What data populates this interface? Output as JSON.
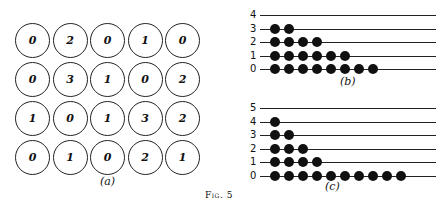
{
  "figure_label": "Fig. 5",
  "panel_a": {
    "caption": "(a)",
    "grid": [
      [
        0,
        2,
        0,
        1,
        0
      ],
      [
        0,
        3,
        1,
        0,
        2
      ],
      [
        1,
        0,
        1,
        3,
        2
      ],
      [
        0,
        1,
        0,
        2,
        1
      ]
    ]
  },
  "chart_data": [
    {
      "type": "scatter",
      "title": "(b)",
      "categories": [
        "4",
        "3",
        "2",
        "1",
        "0"
      ],
      "values": [
        0,
        2,
        4,
        6,
        8
      ],
      "xlabel": "",
      "ylabel": "",
      "grid": false
    },
    {
      "type": "scatter",
      "title": "(c)",
      "categories": [
        "5",
        "4",
        "3",
        "2",
        "1",
        "0"
      ],
      "values": [
        0,
        1,
        2,
        3,
        4,
        10
      ],
      "xlabel": "",
      "ylabel": "",
      "grid": false
    }
  ]
}
